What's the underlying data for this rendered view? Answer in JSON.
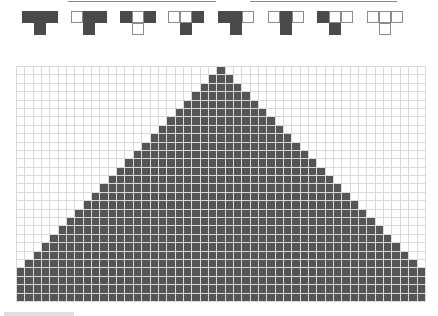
{
  "colors": {
    "on": "#555555",
    "off": "#ffffff",
    "gridline": "#d9d9d9",
    "rule_on": "#4a4a4a",
    "rule_border": "#8c8c8c"
  },
  "rule_icons": [
    {
      "neighborhood": [
        1,
        1,
        1
      ],
      "result": 1
    },
    {
      "neighborhood": [
        0,
        1,
        1
      ],
      "result": 1
    },
    {
      "neighborhood": [
        1,
        0,
        1
      ],
      "result": 0
    },
    {
      "neighborhood": [
        0,
        0,
        1
      ],
      "result": 1
    },
    {
      "neighborhood": [
        1,
        1,
        0
      ],
      "result": 1
    },
    {
      "neighborhood": [
        0,
        1,
        0
      ],
      "result": 1
    },
    {
      "neighborhood": [
        1,
        0,
        0
      ],
      "result": 1
    },
    {
      "neighborhood": [
        0,
        0,
        0
      ],
      "result": 0
    }
  ],
  "rule_icon_x": [
    22,
    71,
    120,
    168,
    218,
    268,
    317,
    367
  ],
  "top_lines": [
    {
      "x": 68,
      "width": 148
    },
    {
      "x": 250,
      "width": 147
    }
  ],
  "grid": {
    "columns": 49,
    "rows": 28,
    "initial_cell_column": 24,
    "pattern": "filled triangle growing one cell per side per row from a single top cell"
  }
}
